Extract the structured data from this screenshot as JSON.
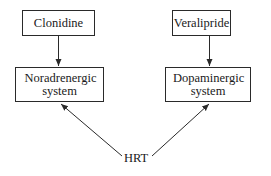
{
  "diagram": {
    "nodes": [
      {
        "id": "clonidine",
        "label": "Clonidine"
      },
      {
        "id": "noradrenergic",
        "label": "Noradrenergic system"
      },
      {
        "id": "veralipride",
        "label": "Veralipride"
      },
      {
        "id": "dopaminergic",
        "label": "Dopaminergic system"
      },
      {
        "id": "hrt",
        "label": "HRT"
      }
    ],
    "edges": [
      {
        "from": "clonidine",
        "to": "noradrenergic"
      },
      {
        "from": "veralipride",
        "to": "dopaminergic"
      },
      {
        "from": "hrt",
        "to": "noradrenergic"
      },
      {
        "from": "hrt",
        "to": "dopaminergic"
      }
    ],
    "colors": {
      "line": "#2a2a2a",
      "text": "#1a1a1a",
      "background": "#ffffff"
    }
  }
}
